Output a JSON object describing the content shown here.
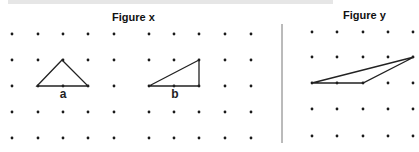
{
  "figures": [
    {
      "id": "x",
      "title": "Figure x",
      "grid": {
        "columns_x": [
          12,
          38,
          63,
          88,
          114,
          149,
          174,
          199,
          225,
          251
        ],
        "rows_y": [
          34,
          60,
          86,
          112,
          138
        ]
      },
      "shapes": [
        {
          "label": "a",
          "points": [
            [
              37,
              86
            ],
            [
              62,
              60
            ],
            [
              88,
              86
            ]
          ],
          "label_pos": [
            63,
            98
          ]
        },
        {
          "label": "b",
          "points": [
            [
              149,
              86
            ],
            [
              199,
              86
            ],
            [
              199,
              60
            ]
          ],
          "label_pos": [
            175,
            98
          ]
        }
      ]
    },
    {
      "id": "y",
      "title": "Figure y",
      "grid": {
        "columns_x": [
          312,
          337,
          363,
          388,
          413
        ],
        "rows_y": [
          32,
          57,
          83,
          109,
          136
        ]
      },
      "shapes": [
        {
          "label": "",
          "points": [
            [
              312,
              83
            ],
            [
              363,
              83
            ],
            [
              414,
              57
            ]
          ]
        }
      ]
    }
  ],
  "divider": {
    "x": 282,
    "y1": 24,
    "y2": 143
  },
  "colors": {
    "dot": "#1a1a1a",
    "line": "#222222",
    "divider": "#777777"
  }
}
